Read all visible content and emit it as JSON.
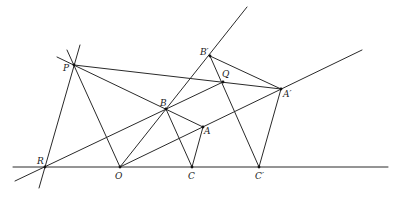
{
  "diagram": {
    "type": "geometric-construction",
    "background": "#ffffff",
    "stroke_color": "#2a2a2a",
    "points": {
      "P": {
        "label": "P",
        "x": 74,
        "y": 65
      },
      "Bp": {
        "label": "B′",
        "x": 210,
        "y": 56
      },
      "Q": {
        "label": "Q",
        "x": 223,
        "y": 82
      },
      "Ap": {
        "label": "A′",
        "x": 281,
        "y": 89
      },
      "B": {
        "label": "B",
        "x": 166,
        "y": 109
      },
      "A": {
        "label": "A",
        "x": 203,
        "y": 127
      },
      "R": {
        "label": "R",
        "x": 45,
        "y": 167
      },
      "O": {
        "label": "O",
        "x": 120,
        "y": 167
      },
      "C": {
        "label": "C",
        "x": 192,
        "y": 167
      },
      "Cp": {
        "label": "C′",
        "x": 259,
        "y": 167
      }
    },
    "lines": [
      {
        "name": "base-line",
        "from": [
          13,
          167
        ],
        "to": [
          388,
          167
        ]
      },
      {
        "name": "line-O-B-Bp",
        "from": [
          120,
          167
        ],
        "to": [
          247,
          7
        ]
      },
      {
        "name": "line-O-A-Ap",
        "from": [
          120,
          167
        ],
        "to": [
          362,
          50
        ]
      },
      {
        "name": "line-R-B-Q",
        "from": [
          15,
          181
        ],
        "to": [
          223,
          82
        ]
      },
      {
        "name": "line-P-R",
        "from": [
          80,
          45
        ],
        "to": [
          39,
          188
        ]
      },
      {
        "name": "line-P-O",
        "from": [
          67,
          50
        ],
        "to": [
          120,
          167
        ]
      },
      {
        "name": "line-P-B-A",
        "from": [
          57,
          57
        ],
        "to": [
          203,
          127
        ]
      },
      {
        "name": "line-P-Ap",
        "from": [
          74,
          65
        ],
        "to": [
          281,
          89
        ]
      },
      {
        "name": "segment-Bp-Ap",
        "from": [
          210,
          56
        ],
        "to": [
          281,
          89
        ]
      },
      {
        "name": "segment-Bp-Cp",
        "from": [
          210,
          56
        ],
        "to": [
          259,
          167
        ]
      },
      {
        "name": "segment-Ap-Cp",
        "from": [
          281,
          89
        ],
        "to": [
          259,
          167
        ]
      },
      {
        "name": "segment-B-C",
        "from": [
          166,
          109
        ],
        "to": [
          192,
          167
        ]
      },
      {
        "name": "segment-A-C",
        "from": [
          203,
          127
        ],
        "to": [
          192,
          167
        ]
      }
    ],
    "labels": [
      {
        "key": "P",
        "text": "P",
        "x": 63,
        "y": 71
      },
      {
        "key": "Bp",
        "text": "B′",
        "x": 200,
        "y": 55
      },
      {
        "key": "Q",
        "text": "Q",
        "x": 222,
        "y": 77
      },
      {
        "key": "Ap",
        "text": "A′",
        "x": 283,
        "y": 97
      },
      {
        "key": "B",
        "text": "B",
        "x": 160,
        "y": 106
      },
      {
        "key": "A",
        "text": "A",
        "x": 204,
        "y": 134
      },
      {
        "key": "R",
        "text": "R",
        "x": 37,
        "y": 164
      },
      {
        "key": "O",
        "text": "O",
        "x": 115,
        "y": 179
      },
      {
        "key": "C",
        "text": "C",
        "x": 188,
        "y": 179
      },
      {
        "key": "Cp",
        "text": "C′",
        "x": 255,
        "y": 179
      }
    ]
  }
}
